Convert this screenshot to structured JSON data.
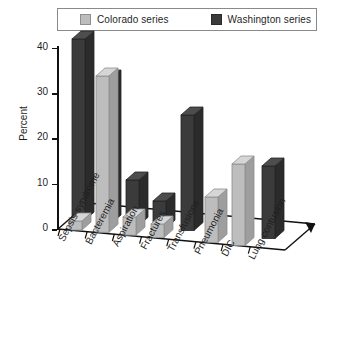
{
  "chart_data": {
    "type": "bar",
    "title": "",
    "subtitle": "",
    "xlabel": "",
    "ylabel": "Percent",
    "ylim": [
      0,
      40
    ],
    "yticks": [
      0,
      10,
      20,
      30,
      40
    ],
    "grid": false,
    "legend_position": "top",
    "style": "3d-clustered-column",
    "categories": [
      "Sepsis syndrome",
      "Bacteremia",
      "Aspiration",
      "Fractures",
      "Transfusions",
      "Pneumonia",
      "DIC",
      "Lung contusion"
    ],
    "series": [
      {
        "name": "Colorado series",
        "color": "#bdbdbd",
        "values": [
          2,
          34.5,
          4,
          3,
          0,
          10,
          18,
          0
        ]
      },
      {
        "name": "Washington series",
        "color": "#3b3b3b",
        "values": [
          40,
          32,
          10,
          6,
          25.5,
          0,
          0,
          16
        ]
      }
    ]
  },
  "legend": {
    "entries": [
      {
        "label": "Colorado series",
        "swatch": "legend-swatch-colorado"
      },
      {
        "label": "Washington series",
        "swatch": "legend-swatch-washington"
      }
    ]
  },
  "axes": {
    "y_title": "Percent",
    "y_tick_labels": [
      "40",
      "30",
      "20",
      "10",
      "0"
    ]
  }
}
